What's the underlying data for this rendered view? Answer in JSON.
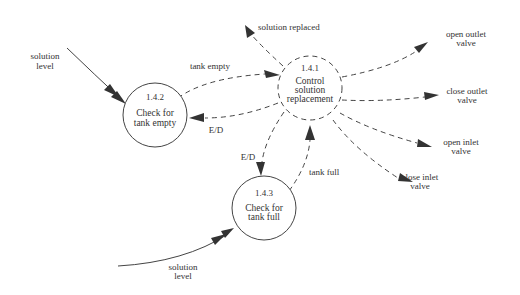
{
  "diagram": {
    "type": "data-flow-diagram",
    "processes": [
      {
        "id": "1.4.1",
        "number": "1.4.1",
        "line1": "Control",
        "line2": "solution",
        "line3": "replacement",
        "style": "dashed"
      },
      {
        "id": "1.4.2",
        "number": "1.4.2",
        "line1": "Check for",
        "line2": "tank empty",
        "style": "solid"
      },
      {
        "id": "1.4.3",
        "number": "1.4.3",
        "line1": "Check for",
        "line2": "tank full",
        "style": "solid"
      }
    ],
    "flows": {
      "solution_level_1": {
        "line1": "solution",
        "line2": "level"
      },
      "solution_level_2": {
        "line1": "solution",
        "line2": "level"
      },
      "tank_empty": "tank empty",
      "tank_full": "tank full",
      "ed_1": "E/D",
      "ed_2": "E/D",
      "solution_replaced": "solution replaced",
      "open_outlet": {
        "line1": "open outlet",
        "line2": "valve"
      },
      "close_outlet": {
        "line1": "close outlet",
        "line2": "valve"
      },
      "open_inlet": {
        "line1": "open inlet",
        "line2": "valve"
      },
      "close_inlet": {
        "line1": "close inlet",
        "line2": "valve"
      }
    }
  }
}
